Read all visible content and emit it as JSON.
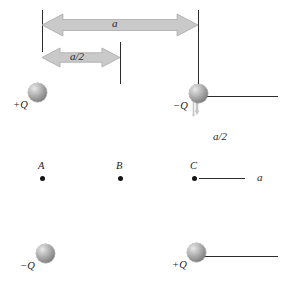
{
  "figure": {
    "type": "physics-charge-configuration-diagram",
    "background_color": "#ffffff",
    "arrow_fill": "#c9c9c9",
    "arrow_stroke": "#a8a8a8",
    "rule_color": "#2c2c2c",
    "text_color": "#1b1b1b"
  },
  "charges": [
    {
      "id": "charge-top-left",
      "label": "+Q",
      "sign": "positive",
      "cx": 37,
      "cy": 92,
      "r": 9.5,
      "label_x": 13,
      "label_y": 99
    },
    {
      "id": "charge-top-right",
      "label": "−Q",
      "sign": "negative",
      "cx": 198,
      "cy": 93,
      "r": 9.5,
      "label_x": 173,
      "label_y": 100
    },
    {
      "id": "charge-bottom-left",
      "label": "−Q",
      "sign": "negative",
      "cx": 45,
      "cy": 253,
      "r": 9.5,
      "label_x": 20,
      "label_y": 260
    },
    {
      "id": "charge-bottom-right",
      "label": "+Q",
      "sign": "positive",
      "cx": 196,
      "cy": 252,
      "r": 9.5,
      "label_x": 172,
      "label_y": 259
    }
  ],
  "field_points": [
    {
      "id": "point-a",
      "label": "A",
      "cx": 42,
      "cy": 178,
      "label_x": 38,
      "label_y": 160
    },
    {
      "id": "point-b",
      "label": "B",
      "cx": 120,
      "cy": 178,
      "label_x": 116,
      "label_y": 160
    },
    {
      "id": "point-c",
      "label": "C",
      "cx": 194,
      "cy": 178,
      "label_x": 190,
      "label_y": 160
    }
  ],
  "dimension_arrows": [
    {
      "id": "arrow-top-a",
      "label": "a",
      "orientation": "horizontal",
      "from": 42,
      "to": 198,
      "axis_pos": 25,
      "thickness": 22,
      "label_x": 112,
      "label_y": 18
    },
    {
      "id": "arrow-top-a-half",
      "label": "a/2",
      "orientation": "horizontal",
      "from": 42,
      "to": 120,
      "axis_pos": 57,
      "thickness": 19,
      "label_x": 70,
      "label_y": 51
    },
    {
      "id": "arrow-right-a-half",
      "label": "a/2",
      "orientation": "vertical",
      "from": 96,
      "to": 178,
      "axis_pos": 228,
      "thickness": 19,
      "label_x": 213,
      "label_y": 131
    },
    {
      "id": "arrow-right-a",
      "label": "a",
      "orientation": "vertical",
      "from": 96,
      "to": 255,
      "axis_pos": 262,
      "thickness": 21,
      "label_x": 257,
      "label_y": 172
    }
  ],
  "reference_rules": [
    {
      "id": "rule-left-vertical",
      "orientation": "vertical",
      "pos": 42,
      "start": 10,
      "end": 52
    },
    {
      "id": "rule-mid-vertical",
      "orientation": "vertical",
      "pos": 120,
      "start": 42,
      "end": 84
    },
    {
      "id": "rule-right-vertical",
      "orientation": "vertical",
      "pos": 198,
      "start": 10,
      "end": 84
    },
    {
      "id": "rule-top-right-horizontal",
      "orientation": "horizontal",
      "pos": 96,
      "start": 205,
      "end": 278
    },
    {
      "id": "rule-point-c-horizontal",
      "orientation": "horizontal",
      "pos": 178,
      "start": 199,
      "end": 245
    },
    {
      "id": "rule-bottom-horizontal",
      "orientation": "horizontal",
      "pos": 256,
      "start": 203,
      "end": 278
    }
  ]
}
